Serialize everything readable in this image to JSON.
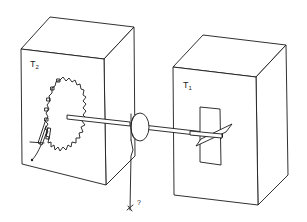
{
  "diagram": {
    "type": "schematic-line-drawing",
    "stroke_color": "#1a1a1a",
    "background_color": "#ffffff",
    "left_box": {
      "label_main": "T",
      "label_sub": "2",
      "contents": "ratchet-and-pawl"
    },
    "right_box": {
      "label_main": "T",
      "label_sub": "1",
      "contents": "vane"
    },
    "pulley": {
      "contents": "wheel-on-axle"
    },
    "weight": {
      "label": "?"
    }
  }
}
